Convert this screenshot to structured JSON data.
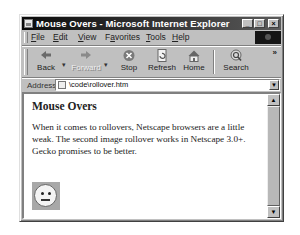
{
  "window": {
    "title": "Mouse Overs - Microsoft Internet Explorer",
    "controls": {
      "minimize": "_",
      "maximize": "□",
      "close": "×"
    }
  },
  "menubar": {
    "items": [
      {
        "label": "File",
        "accel": "F",
        "rest": "ile"
      },
      {
        "label": "Edit",
        "accel": "E",
        "rest": "dit"
      },
      {
        "label": "View",
        "accel": "V",
        "rest": "iew"
      },
      {
        "label": "Favorites",
        "pre": "F",
        "accel": "a",
        "rest": "vorites"
      },
      {
        "label": "Tools",
        "accel": "T",
        "rest": "ools"
      },
      {
        "label": "Help",
        "accel": "H",
        "rest": "elp"
      }
    ]
  },
  "toolbar": {
    "buttons": [
      {
        "label": "Back",
        "icon": "back-arrow-icon",
        "enabled": true
      },
      {
        "label": "Forward",
        "icon": "forward-arrow-icon",
        "enabled": false
      },
      {
        "label": "Stop",
        "icon": "stop-icon",
        "enabled": true
      },
      {
        "label": "Refresh",
        "icon": "refresh-icon",
        "enabled": true
      },
      {
        "label": "Home",
        "icon": "home-icon",
        "enabled": true
      },
      {
        "label": "Search",
        "icon": "search-icon",
        "enabled": true
      }
    ],
    "overflow": "»"
  },
  "addressbar": {
    "label": "Address",
    "url": "\\code\\rollover.htm"
  },
  "content": {
    "heading": "Mouse Overs",
    "paragraph": "When it comes to rollovers, Netscape browsers are a little weak. The second image rollover works in Netscape 3.0+. Gecko promises to be better.",
    "image": "neutral-face-rollover-image"
  },
  "scrollbar": {
    "up": "▲",
    "down": "▼"
  }
}
